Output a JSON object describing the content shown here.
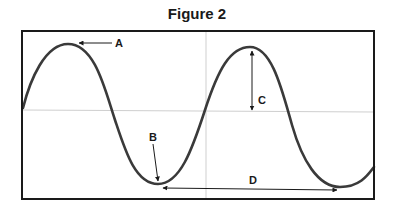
{
  "figure": {
    "title": "Figure 2",
    "labels": {
      "a": "A",
      "b": "B",
      "c": "C",
      "d": "D"
    }
  },
  "colors": {
    "wave": "#3a3a3a",
    "frame": "#1a1a1a",
    "grid": "#cfcfcf",
    "arrow": "#1a1a1a"
  }
}
